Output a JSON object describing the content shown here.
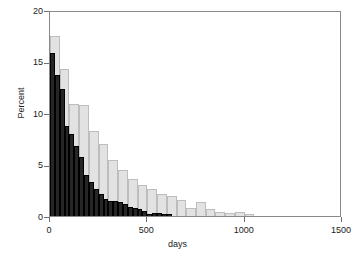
{
  "chart_data": {
    "type": "bar",
    "title": "",
    "subtitle": "",
    "xlabel": "days",
    "ylabel": "Percent",
    "xlim": [
      0,
      1500
    ],
    "ylim": [
      0,
      20
    ],
    "xticks": [
      0,
      500,
      1000,
      1500
    ],
    "xtick_labels": [
      "0",
      "500",
      "1000",
      "1500"
    ],
    "yticks": [
      0,
      5,
      10,
      15,
      20
    ],
    "ytick_labels": [
      "0",
      "5",
      "10",
      "15",
      "20"
    ],
    "grid": false,
    "legend": null,
    "legend_position": "none",
    "annotations": [],
    "series": [
      {
        "name": "light-gray-histogram",
        "color": "#e2e2e2",
        "edge_color": "#bdbdbd",
        "bin_width": 50,
        "bin_starts": [
          0,
          50,
          100,
          150,
          200,
          250,
          300,
          350,
          400,
          450,
          500,
          550,
          600,
          650,
          700,
          750,
          800,
          850,
          900,
          950,
          1000
        ],
        "values": [
          17.5,
          14.3,
          10.9,
          10.8,
          8.3,
          7.0,
          5.4,
          4.5,
          3.6,
          3.0,
          2.6,
          2.1,
          1.9,
          1.6,
          0.8,
          1.4,
          0.7,
          0.4,
          0.25,
          0.35,
          0.2
        ]
      },
      {
        "name": "dark-histogram",
        "color": "#262626",
        "edge_color": "#000000",
        "bin_width": 25,
        "bin_starts": [
          0,
          25,
          50,
          75,
          100,
          125,
          150,
          175,
          200,
          225,
          250,
          275,
          300,
          325,
          350,
          375,
          400,
          425,
          450,
          475,
          500,
          525,
          550,
          575,
          600
        ],
        "values": [
          15.8,
          13.7,
          12.3,
          8.7,
          8.0,
          6.8,
          5.7,
          4.0,
          3.3,
          2.6,
          2.1,
          1.7,
          1.5,
          1.5,
          1.4,
          1.2,
          0.9,
          0.8,
          0.7,
          0.5,
          0.2,
          0.3,
          0.25,
          0.2,
          0.15
        ]
      }
    ]
  }
}
